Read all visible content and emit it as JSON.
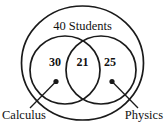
{
  "figure": {
    "type": "venn-diagram",
    "universe_label": "40 Students",
    "universe_total": 40,
    "background_color": "#ffffff",
    "stroke_color": "#1a1a1a",
    "text_color": "#111111"
  },
  "sets": {
    "left": {
      "name": "Calculus",
      "label": "Calculus",
      "only_count": "30"
    },
    "right": {
      "name": "Physics",
      "label": "Physics",
      "only_count": "25"
    },
    "intersection": {
      "name": "Calculus and Physics",
      "count": "21"
    }
  },
  "regions": [
    {
      "id": "calculus-only",
      "value": "30"
    },
    {
      "id": "both",
      "value": "21"
    },
    {
      "id": "physics-only",
      "value": "25"
    }
  ],
  "annotations": {
    "left_leader": "Calculus",
    "right_leader": "Physics"
  }
}
